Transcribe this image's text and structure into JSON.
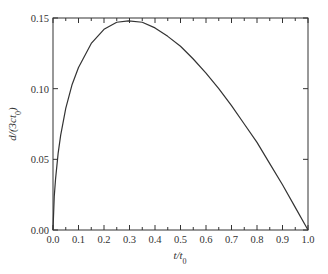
{
  "chart_data": {
    "type": "line",
    "title": "",
    "xlabel": "t/t0",
    "ylabel": "d/(3ct0)",
    "xlim": [
      0.0,
      1.0
    ],
    "ylim": [
      0.0,
      0.15
    ],
    "grid": false,
    "legend": null,
    "x_ticks": [
      "0.0",
      "0.1",
      "0.2",
      "0.3",
      "0.4",
      "0.5",
      "0.6",
      "0.7",
      "0.8",
      "0.9",
      "1.0"
    ],
    "y_ticks": [
      "0.00",
      "0.05",
      "0.10",
      "0.15"
    ],
    "series": [
      {
        "name": "d/(3ct0)",
        "color": "#333333",
        "x": [
          0.0,
          0.005,
          0.01,
          0.02,
          0.03,
          0.05,
          0.075,
          0.1,
          0.15,
          0.2,
          0.25,
          0.296,
          0.35,
          0.4,
          0.45,
          0.5,
          0.55,
          0.6,
          0.65,
          0.7,
          0.75,
          0.8,
          0.85,
          0.9,
          0.95,
          1.0
        ],
        "values": [
          0.0,
          0.024,
          0.036,
          0.054,
          0.067,
          0.086,
          0.103,
          0.115,
          0.132,
          0.142,
          0.147,
          0.148,
          0.147,
          0.143,
          0.137,
          0.13,
          0.121,
          0.111,
          0.1,
          0.088,
          0.075,
          0.062,
          0.047,
          0.032,
          0.016,
          0.0
        ]
      }
    ],
    "annotations": []
  }
}
